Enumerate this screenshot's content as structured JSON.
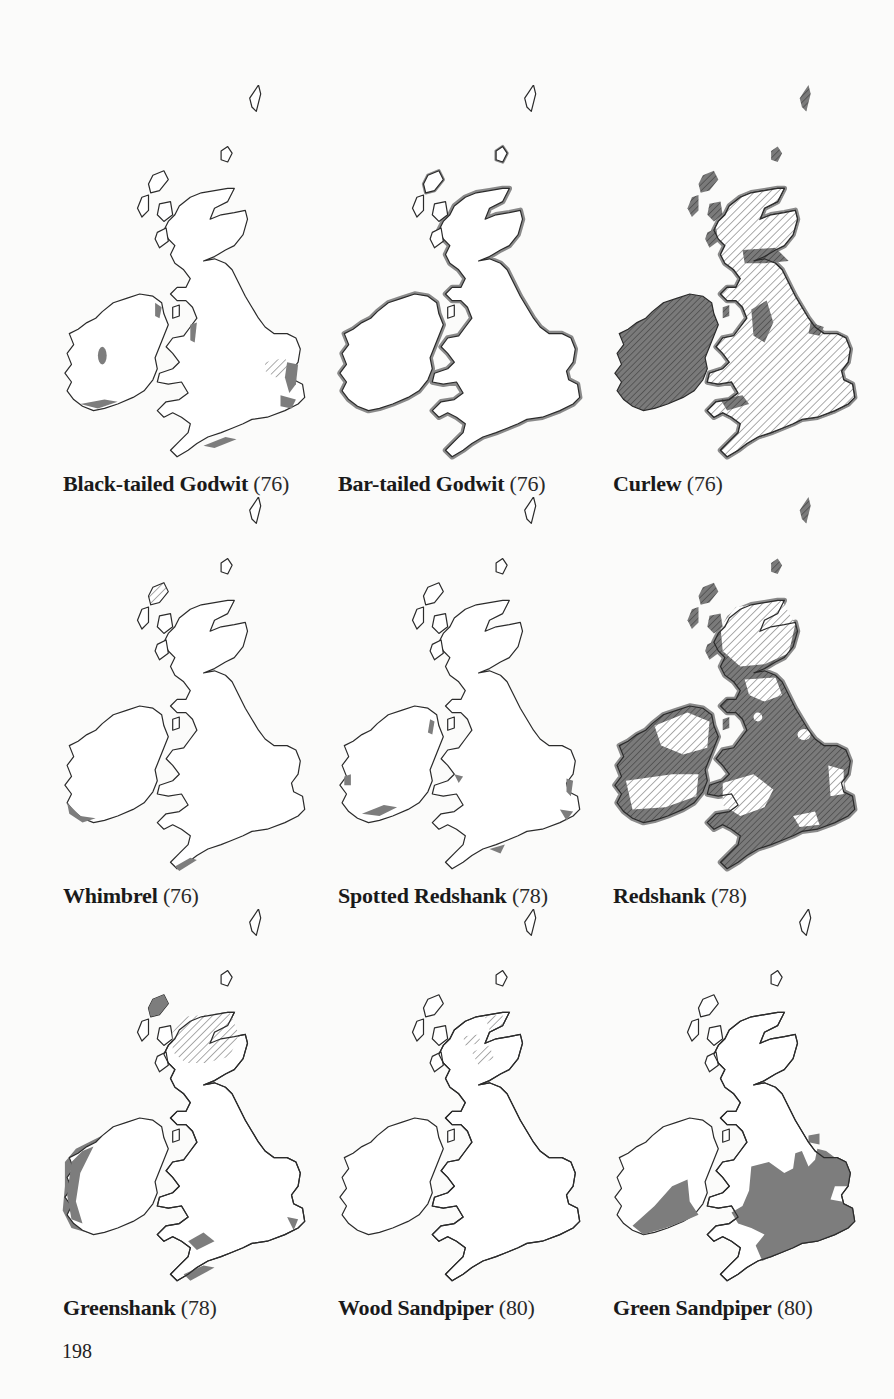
{
  "page": {
    "page_number": "198",
    "background_color": "#fbfbfa",
    "fill_color": "#7d7d7d",
    "outline_color": "#2b2b2b"
  },
  "maps": [
    {
      "name": "Black-tailed Godwit",
      "ref": "(76)",
      "pattern": "sparse coastal patches, central Ireland patch, hatched East Anglia"
    },
    {
      "name": "Bar-tailed Godwit",
      "ref": "(76)",
      "pattern": "grey band along most coasts"
    },
    {
      "name": "Curlew",
      "ref": "(76)",
      "pattern": "Ireland dense hatched, Britain light hatched with dense patches"
    },
    {
      "name": "Whimbrel",
      "ref": "(76)",
      "pattern": "few SW coastal patches, hatched Outer Hebrides"
    },
    {
      "name": "Spotted Redshank",
      "ref": "(78)",
      "pattern": "scattered coastal grey patches"
    },
    {
      "name": "Redshank",
      "ref": "(78)",
      "pattern": "widespread dense hatched inland, light hatched Scotland, grey coastal band"
    },
    {
      "name": "Greenshank",
      "ref": "(78)",
      "pattern": "hatched NW Scotland, grey west Ireland and south coasts"
    },
    {
      "name": "Wood Sandpiper",
      "ref": "(80)",
      "pattern": "light hatched patches in northern Scotland"
    },
    {
      "name": "Green Sandpiper",
      "ref": "(80)",
      "pattern": "solid grey over England and SW Ireland"
    }
  ]
}
